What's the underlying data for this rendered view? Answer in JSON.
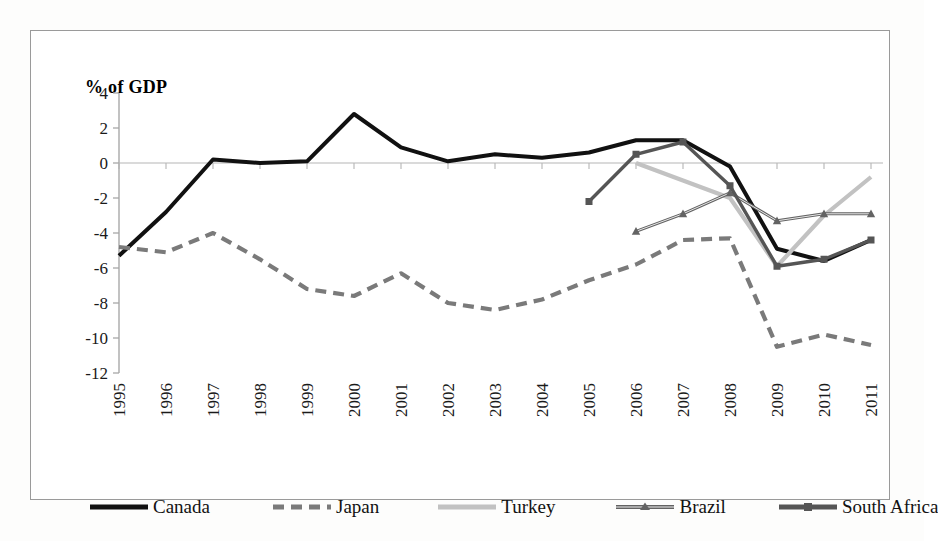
{
  "chart_data": {
    "type": "line",
    "title": "",
    "ylabel": "% of GDP",
    "xlabel": "",
    "ylim": [
      -12,
      4
    ],
    "yticks": [
      4,
      2,
      0,
      -2,
      -4,
      -6,
      -8,
      -10,
      -12
    ],
    "ytick_labels": [
      "4",
      "2",
      "0",
      "-2",
      "-4",
      "-6",
      "-8",
      "-10",
      "-12"
    ],
    "grid": false,
    "legend_position": "bottom",
    "categories": [
      "1995",
      "1996",
      "1997",
      "1998",
      "1999",
      "2000",
      "2001",
      "2002",
      "2003",
      "2004",
      "2005",
      "2006",
      "2007",
      "2008",
      "2009",
      "2010",
      "2011"
    ],
    "series": [
      {
        "name": "Canada",
        "color": "#111111",
        "style": "solid",
        "marker": "none",
        "values": [
          -5.3,
          -2.8,
          0.2,
          0.0,
          0.1,
          2.8,
          0.9,
          0.1,
          0.5,
          0.3,
          0.6,
          1.3,
          1.3,
          -0.2,
          -4.9,
          -5.6,
          -4.4
        ]
      },
      {
        "name": "Japan",
        "color": "#7a7a7a",
        "style": "dashed",
        "marker": "none",
        "values": [
          -4.8,
          -5.1,
          -4.0,
          -5.5,
          -7.2,
          -7.6,
          -6.3,
          -8.0,
          -8.4,
          -7.8,
          -6.7,
          -5.8,
          -4.4,
          -4.3,
          -10.5,
          -9.8,
          -10.4
        ]
      },
      {
        "name": "Turkey",
        "color": "#c2c2c2",
        "style": "solid",
        "marker": "none",
        "values": [
          null,
          null,
          null,
          null,
          null,
          null,
          null,
          null,
          null,
          null,
          null,
          0.0,
          -1.0,
          -2.0,
          -5.9,
          -3.0,
          -0.8
        ]
      },
      {
        "name": "Brazil",
        "color": "#636363",
        "style": "solid",
        "marker": "triangle",
        "values": [
          null,
          null,
          null,
          null,
          null,
          null,
          null,
          null,
          null,
          null,
          null,
          -3.9,
          -2.9,
          -1.7,
          -3.3,
          -2.9,
          -2.9
        ]
      },
      {
        "name": "South Africa",
        "color": "#555555",
        "style": "solid",
        "marker": "square",
        "values": [
          null,
          null,
          null,
          null,
          null,
          null,
          null,
          null,
          null,
          null,
          -2.2,
          0.5,
          1.2,
          -1.3,
          -5.9,
          -5.5,
          -4.4
        ]
      }
    ]
  },
  "legend": {
    "items": [
      {
        "label": "Canada"
      },
      {
        "label": "Japan"
      },
      {
        "label": "Turkey"
      },
      {
        "label": "Brazil"
      },
      {
        "label": "South Africa"
      }
    ]
  }
}
